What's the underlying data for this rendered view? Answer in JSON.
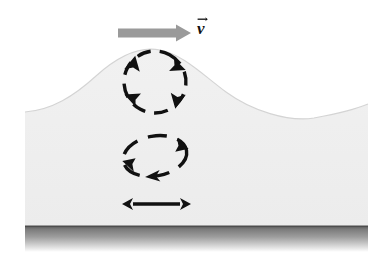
{
  "figure": {
    "background_color": "#ffffff",
    "water_color": "#efefef",
    "water_edge_color": "#d8d8d8",
    "seabed_top_color": "#6f6f6f",
    "seabed_bottom_color": "#ffffff",
    "ink_color": "#111111",
    "arrow_gray": "#9a9a9a"
  },
  "velocity_arrow": {
    "name": "wave propagation direction",
    "color": "#9a9a9a",
    "direction": "right",
    "x_start": 118,
    "x_end": 190,
    "y": 32
  },
  "velocity_label": {
    "text": "v",
    "vector_accent": "arrow",
    "x": 199,
    "y": 21,
    "color": "#111111"
  },
  "orbits": [
    {
      "name": "surface-circular-orbit",
      "shape": "circle",
      "cx": 155,
      "cy": 82,
      "rx": 31,
      "ry": 31,
      "rotation": "clockwise",
      "dashed": true,
      "arrowhead_count": 4
    },
    {
      "name": "mid-depth-elliptical-orbit",
      "shape": "ellipse",
      "cx": 155,
      "cy": 156,
      "rx": 32,
      "ry": 20,
      "rotation": "clockwise",
      "dashed": true,
      "arrowhead_count": 3
    }
  ],
  "bottom_motion": {
    "name": "horizontal-oscillation",
    "shape": "double-headed-arrow",
    "x_left": 127,
    "x_right": 186,
    "y": 204,
    "color": "#111111"
  },
  "surface_profile": {
    "description": "single wave crest with trough to the right",
    "crest_x": 160,
    "crest_y": 50,
    "trough_x": 320,
    "trough_y": 118,
    "left_edge_y": 112,
    "right_edge_y": 108
  },
  "seabed": {
    "name": "sea-floor-band",
    "top_y": 226,
    "bottom_y": 252,
    "left_x": 25,
    "right_x": 368
  },
  "canvas": {
    "width": 382,
    "height": 269,
    "content_left": 25,
    "content_right": 368
  }
}
